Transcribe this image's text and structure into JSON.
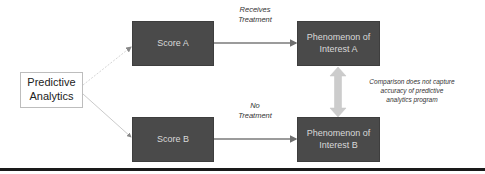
{
  "diagram": {
    "nodes": {
      "predictive": {
        "label_line1": "Predictive",
        "label_line2": "Analytics"
      },
      "score_a": {
        "label": "Score A"
      },
      "score_b": {
        "label": "Score B"
      },
      "phenomenon_a": {
        "label_line1": "Phenomenon of",
        "label_line2": "Interest A"
      },
      "phenomenon_b": {
        "label_line1": "Phenomenon of",
        "label_line2": "Interest B"
      }
    },
    "edge_labels": {
      "receives_treatment": {
        "line1": "Receives",
        "line2": "Treatment"
      },
      "no_treatment": {
        "line1": "No",
        "line2": "Treatment"
      },
      "comparison": {
        "line1": "Comparison does not capture",
        "line2": "accuracy of predictive",
        "line3": "analytics program"
      }
    },
    "colors": {
      "dark_box": "#4a4a4a",
      "dark_box_text": "#d9d9d9",
      "arrow": "#7a7a7a",
      "comparison_arrow": "#cccccc",
      "rule": "#1a1a1a"
    }
  }
}
